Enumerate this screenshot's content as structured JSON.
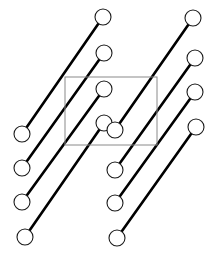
{
  "figure": {
    "type": "diagram",
    "width": 217,
    "height": 260,
    "background_color": "#ffffff",
    "bond_color": "#000000",
    "bond_width": 2.6,
    "atom_fill_color": "#ffffff",
    "atom_stroke_color": "#1a1a1a",
    "atom_stroke_width": 1.1,
    "atom_radius": 8.0,
    "unit_cell_stroke_color": "#8a8a8a",
    "unit_cell_stroke_width": 1.0
  },
  "unit_cell": {
    "label": "unit-cell",
    "x": 65,
    "y": 77,
    "width": 92,
    "height": 68
  },
  "molecules": [
    {
      "id": "molecule-1",
      "label": "diatomic-bond-1",
      "atom_a": {
        "label": "atom-1a",
        "cx": 22,
        "cy": 134
      },
      "atom_b": {
        "label": "atom-1b",
        "cx": 103,
        "cy": 17
      }
    },
    {
      "id": "molecule-2",
      "label": "diatomic-bond-2",
      "atom_a": {
        "label": "atom-2a",
        "cx": 22,
        "cy": 168
      },
      "atom_b": {
        "label": "atom-2b",
        "cx": 104,
        "cy": 53
      }
    },
    {
      "id": "molecule-3",
      "label": "diatomic-bond-3",
      "atom_a": {
        "label": "atom-3a",
        "cx": 22,
        "cy": 202
      },
      "atom_b": {
        "label": "atom-3b",
        "cx": 104,
        "cy": 89
      }
    },
    {
      "id": "molecule-4",
      "label": "diatomic-bond-4",
      "atom_a": {
        "label": "atom-4a",
        "cx": 25,
        "cy": 237
      },
      "atom_b": {
        "label": "atom-4b",
        "cx": 104,
        "cy": 123
      }
    },
    {
      "id": "molecule-5",
      "label": "diatomic-bond-5",
      "atom_a": {
        "label": "atom-5a",
        "cx": 115,
        "cy": 130
      },
      "atom_b": {
        "label": "atom-5b",
        "cx": 193,
        "cy": 18
      }
    },
    {
      "id": "molecule-6",
      "label": "diatomic-bond-6",
      "atom_a": {
        "label": "atom-6a",
        "cx": 115,
        "cy": 170
      },
      "atom_b": {
        "label": "atom-6b",
        "cx": 195,
        "cy": 58
      }
    },
    {
      "id": "molecule-7",
      "label": "diatomic-bond-7",
      "atom_a": {
        "label": "atom-7a",
        "cx": 115,
        "cy": 203
      },
      "atom_b": {
        "label": "atom-7b",
        "cx": 195,
        "cy": 92
      }
    },
    {
      "id": "molecule-8",
      "label": "diatomic-bond-8",
      "atom_a": {
        "label": "atom-8a",
        "cx": 117,
        "cy": 238
      },
      "atom_b": {
        "label": "atom-8b",
        "cx": 196,
        "cy": 127
      }
    }
  ]
}
